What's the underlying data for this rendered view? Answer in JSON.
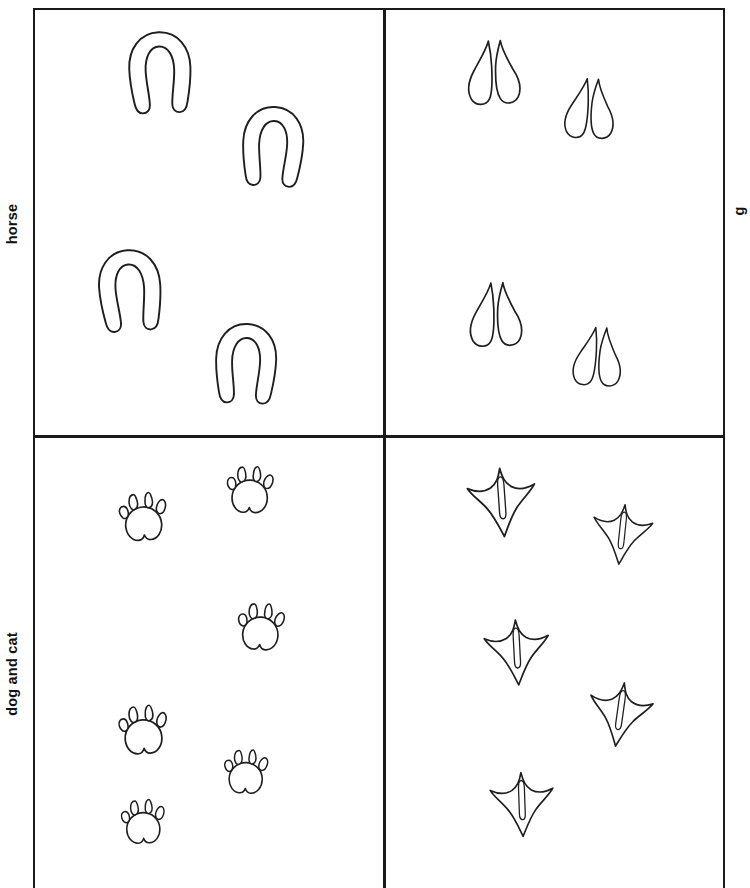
{
  "figure": {
    "type": "animal-track-identification-chart",
    "background_color": "#ffffff",
    "ink_color": "#1a1a1a",
    "border_width_px": 2.6,
    "grid": {
      "rows": 2,
      "columns": 2
    }
  },
  "row_labels": [
    {
      "id": "row-horse",
      "text": "horse",
      "orientation": "rotated-90-ccw",
      "side": "left"
    },
    {
      "id": "row-dogcat",
      "text": "dog and cat",
      "orientation": "rotated-90-ccw",
      "side": "left"
    }
  ],
  "right_labels": [
    {
      "id": "right-top",
      "text": "g",
      "orientation": "rotated-90-ccw",
      "clipped": "true"
    },
    {
      "id": "right-bottom",
      "text": "",
      "orientation": "rotated-90-ccw",
      "clipped": "true"
    }
  ],
  "cells": [
    {
      "id": "cell-horse",
      "row_label": "horse",
      "column": 1,
      "track_type": "horseshoe",
      "track_count": 4,
      "tracks": [
        {
          "x": 92,
          "y": 22,
          "scale": 1.02,
          "rotation": -2
        },
        {
          "x": 205,
          "y": 96,
          "scale": 1.0,
          "rotation": 3
        },
        {
          "x": 62,
          "y": 240,
          "scale": 1.02,
          "rotation": -4
        },
        {
          "x": 178,
          "y": 313,
          "scale": 1.0,
          "rotation": 2
        }
      ]
    },
    {
      "id": "cell-deer",
      "row_label": "horse",
      "column": 2,
      "track_type": "cloven-hoof",
      "track_count": 4,
      "tracks": [
        {
          "x": 76,
          "y": 30,
          "scale": 1.0,
          "rotation": -3
        },
        {
          "x": 172,
          "y": 66,
          "scale": 0.94,
          "rotation": 2
        },
        {
          "x": 78,
          "y": 272,
          "scale": 1.0,
          "rotation": -2
        },
        {
          "x": 180,
          "y": 314,
          "scale": 0.92,
          "rotation": 3
        }
      ]
    },
    {
      "id": "cell-dogcat",
      "row_label": "dog and cat",
      "column": 1,
      "track_type": "paw-print",
      "track_count": 6,
      "tracks": [
        {
          "x": 78,
          "y": 45,
          "scale": 1.0,
          "rotation": -4
        },
        {
          "x": 185,
          "y": 18,
          "scale": 0.98,
          "rotation": 2
        },
        {
          "x": 196,
          "y": 155,
          "scale": 0.98,
          "rotation": 4
        },
        {
          "x": 78,
          "y": 258,
          "scale": 1.02,
          "rotation": -3
        },
        {
          "x": 181,
          "y": 300,
          "scale": 0.92,
          "rotation": 2
        },
        {
          "x": 78,
          "y": 350,
          "scale": 0.92,
          "rotation": -2
        }
      ]
    },
    {
      "id": "cell-bird",
      "row_label": "dog and cat",
      "column": 2,
      "track_type": "webbed-bird-foot",
      "track_count": 5,
      "tracks": [
        {
          "x": 80,
          "y": 28,
          "scale": 1.05,
          "rotation": -4
        },
        {
          "x": 200,
          "y": 60,
          "scale": 0.92,
          "rotation": 6
        },
        {
          "x": 95,
          "y": 178,
          "scale": 1.0,
          "rotation": -3
        },
        {
          "x": 198,
          "y": 240,
          "scale": 0.98,
          "rotation": 8
        },
        {
          "x": 100,
          "y": 330,
          "scale": 0.98,
          "rotation": -2
        }
      ]
    }
  ]
}
